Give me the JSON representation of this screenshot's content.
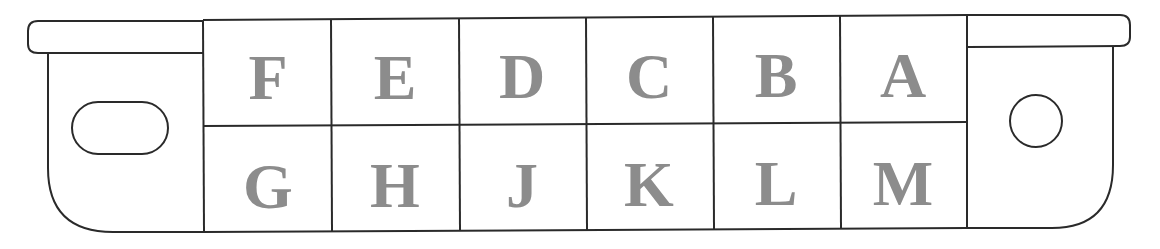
{
  "diagram": {
    "colors": {
      "outline": "#2a2a2a",
      "label": "#8c8c8c",
      "background": "#ffffff"
    },
    "top_row": [
      "F",
      "E",
      "D",
      "C",
      "B",
      "A"
    ],
    "bottom_row": [
      "G",
      "H",
      "J",
      "K",
      "L",
      "M"
    ],
    "left_key": "oval-slot",
    "right_key": "round-hole"
  }
}
